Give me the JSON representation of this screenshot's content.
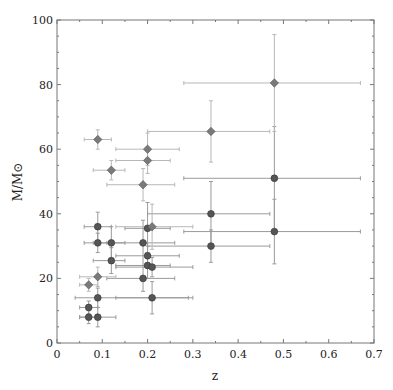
{
  "chart_data": {
    "type": "scatter",
    "title": "",
    "xlabel": "z",
    "ylabel": "M/M⊙",
    "xlim": [
      0,
      0.7
    ],
    "ylim": [
      0,
      100
    ],
    "xticks": [
      "0",
      "0.1",
      "0.2",
      "0.3",
      "0.4",
      "0.5",
      "0.6",
      "0.7"
    ],
    "yticks": [
      "0",
      "20",
      "40",
      "60",
      "80",
      "100"
    ],
    "grid": false,
    "legend": null,
    "series": [
      {
        "name": "circles",
        "marker": "circle",
        "color": "#555555",
        "errcolor": "#9a9a9a",
        "points": [
          {
            "x": 0.07,
            "y": 8,
            "xerr": [
              0.02,
              0.02
            ],
            "yerr": [
              2,
              2
            ]
          },
          {
            "x": 0.09,
            "y": 8,
            "xerr": [
              0.04,
              0.04
            ],
            "yerr": [
              3,
              3
            ]
          },
          {
            "x": 0.07,
            "y": 11,
            "xerr": [
              0.02,
              0.02
            ],
            "yerr": [
              2,
              2
            ]
          },
          {
            "x": 0.09,
            "y": 14,
            "xerr": [
              0.05,
              0.2
            ],
            "yerr": [
              3,
              3
            ]
          },
          {
            "x": 0.09,
            "y": 31,
            "xerr": [
              0.03,
              0.03
            ],
            "yerr": [
              3,
              3
            ]
          },
          {
            "x": 0.09,
            "y": 36,
            "xerr": [
              0.03,
              0.03
            ],
            "yerr": [
              4.5,
              4.5
            ]
          },
          {
            "x": 0.12,
            "y": 31,
            "xerr": [
              0.04,
              0.03
            ],
            "yerr": [
              5,
              5
            ]
          },
          {
            "x": 0.12,
            "y": 25.5,
            "xerr": [
              0.04,
              0.03
            ],
            "yerr": [
              4,
              4
            ]
          },
          {
            "x": 0.19,
            "y": 31,
            "xerr": [
              0.08,
              0.07
            ],
            "yerr": [
              7,
              7
            ]
          },
          {
            "x": 0.19,
            "y": 20,
            "xerr": [
              0.08,
              0.07
            ],
            "yerr": [
              4,
              4
            ]
          },
          {
            "x": 0.2,
            "y": 35.5,
            "xerr": [
              0.05,
              0.05
            ],
            "yerr": [
              8,
              8
            ]
          },
          {
            "x": 0.2,
            "y": 27,
            "xerr": [
              0.07,
              0.07
            ],
            "yerr": [
              3,
              3
            ]
          },
          {
            "x": 0.2,
            "y": 24,
            "xerr": [
              0.07,
              0.05
            ],
            "yerr": [
              4,
              4
            ]
          },
          {
            "x": 0.21,
            "y": 23.5,
            "xerr": [
              0.08,
              0.09
            ],
            "yerr": [
              3,
              3
            ]
          },
          {
            "x": 0.21,
            "y": 14,
            "xerr": [
              0.08,
              0.09
            ],
            "yerr": [
              5,
              5
            ]
          },
          {
            "x": 0.34,
            "y": 40,
            "xerr": [
              0.14,
              0.13
            ],
            "yerr": [
              10,
              10
            ]
          },
          {
            "x": 0.34,
            "y": 30,
            "xerr": [
              0.14,
              0.13
            ],
            "yerr": [
              5,
              5
            ]
          },
          {
            "x": 0.48,
            "y": 51,
            "xerr": [
              0.2,
              0.19
            ],
            "yerr": [
              16,
              16
            ]
          },
          {
            "x": 0.48,
            "y": 34.5,
            "xerr": [
              0.2,
              0.19
            ],
            "yerr": [
              10,
              10
            ]
          }
        ]
      },
      {
        "name": "diamonds",
        "marker": "diamond",
        "color": "#7a7a7a",
        "errcolor": "#b8b8b8",
        "points": [
          {
            "x": 0.07,
            "y": 18,
            "xerr": [
              0.02,
              0.02
            ],
            "yerr": [
              2,
              2
            ]
          },
          {
            "x": 0.09,
            "y": 20.5,
            "xerr": [
              0.04,
              0.04
            ],
            "yerr": [
              3,
              3
            ]
          },
          {
            "x": 0.09,
            "y": 63,
            "xerr": [
              0.03,
              0.03
            ],
            "yerr": [
              3,
              3
            ]
          },
          {
            "x": 0.12,
            "y": 53.5,
            "xerr": [
              0.04,
              0.03
            ],
            "yerr": [
              3,
              3
            ]
          },
          {
            "x": 0.19,
            "y": 49,
            "xerr": [
              0.08,
              0.07
            ],
            "yerr": [
              5,
              5
            ]
          },
          {
            "x": 0.2,
            "y": 60,
            "xerr": [
              0.07,
              0.07
            ],
            "yerr": [
              5,
              5
            ]
          },
          {
            "x": 0.2,
            "y": 56.5,
            "xerr": [
              0.07,
              0.05
            ],
            "yerr": [
              4,
              4
            ]
          },
          {
            "x": 0.21,
            "y": 36,
            "xerr": [
              0.08,
              0.09
            ],
            "yerr": [
              7,
              7
            ]
          },
          {
            "x": 0.34,
            "y": 65.5,
            "xerr": [
              0.14,
              0.13
            ],
            "yerr": [
              9.5,
              9.5
            ]
          },
          {
            "x": 0.48,
            "y": 80.5,
            "xerr": [
              0.2,
              0.19
            ],
            "yerr": [
              15,
              15
            ]
          }
        ]
      }
    ]
  }
}
